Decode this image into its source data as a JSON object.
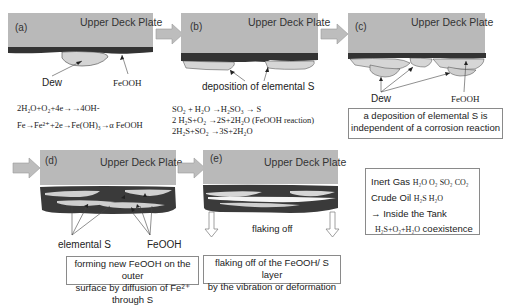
{
  "figure": {
    "plate_label": "Upper Deck Plate",
    "panels": [
      {
        "id": "(a)",
        "labels": [
          "Dew",
          "FeOOH"
        ],
        "equations": [
          "2H₂O+O₂+4e→→4OH-",
          "Fe→Fe²⁺+2e→Fe(OH)₃→α FeOOH"
        ]
      },
      {
        "id": "(b)",
        "labels": [
          "deposition of elemental S"
        ],
        "equations": [
          "SO₂ + H₂O →H₂SO₃ → S",
          "2 H₂S+O₂ →2S+2H₂O (FeOOH reaction)",
          "2H₂S+SO₂ →3S+2H₂O"
        ]
      },
      {
        "id": "(c)",
        "labels": [
          "Dew",
          "FeOOH"
        ],
        "caption": [
          "a deposition of elemental S is",
          "independent of a corrosion reaction"
        ]
      },
      {
        "id": "(d)",
        "labels": [
          "elemental S",
          "FeOOH"
        ],
        "caption": [
          "forming new FeOOH on the outer",
          "surface by diffusion of Fe²⁺ through S"
        ]
      },
      {
        "id": "(e)",
        "labels": [
          "flaking off"
        ],
        "caption": [
          "flaking off of the FeOOH/ S layer",
          "by the vibration or deformation"
        ]
      }
    ],
    "info_box": {
      "lines": [
        {
          "label": "Inert Gas",
          "formula": "H₂O  O₂ SO₂ CO₂"
        },
        {
          "label": "Crude Oil",
          "formula": "H₂S  H₂O"
        },
        {
          "label": "→ Inside the Tank",
          "formula": ""
        },
        {
          "label": "coexistence",
          "formula": "H₂S+O₂+H₂O"
        }
      ]
    },
    "colors": {
      "plate": "#b9b9b9",
      "rust": "#3a3a3a",
      "dew": "#cfcfcf",
      "arrow": "#b5b5b5"
    }
  }
}
